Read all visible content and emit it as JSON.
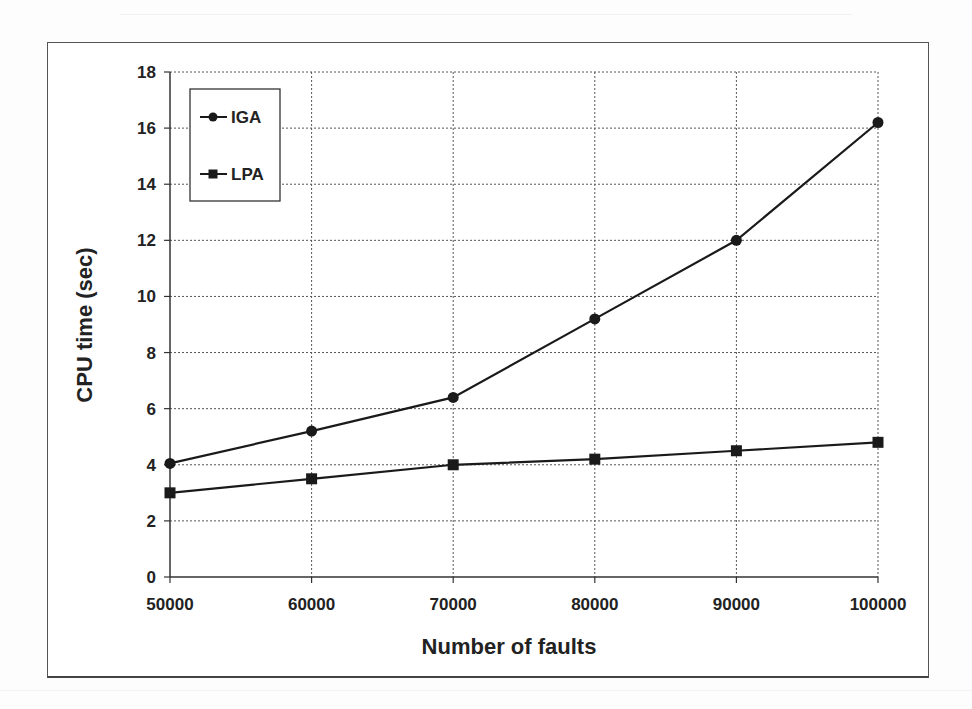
{
  "chart_data": {
    "type": "line",
    "title": "",
    "xlabel": "Number of faults",
    "ylabel": "CPU time (sec)",
    "x": [
      50000,
      60000,
      70000,
      80000,
      90000,
      100000
    ],
    "x_tick_labels": [
      "50000",
      "60000",
      "70000",
      "80000",
      "90000",
      "100000"
    ],
    "y_tick_labels": [
      "0",
      "2",
      "4",
      "6",
      "8",
      "10",
      "12",
      "14",
      "16",
      "18"
    ],
    "ylim": [
      0,
      18
    ],
    "grid": true,
    "legend_position": "upper-left",
    "series": [
      {
        "name": "IGA",
        "marker": "circle",
        "values": [
          4.05,
          5.2,
          6.4,
          9.2,
          12.0,
          16.2
        ]
      },
      {
        "name": "LPA",
        "marker": "square",
        "values": [
          3.0,
          3.5,
          4.0,
          4.2,
          4.5,
          4.8
        ]
      }
    ]
  },
  "colors": {
    "line": "#1a1a1a",
    "grid": "#555555",
    "text": "#222222"
  }
}
